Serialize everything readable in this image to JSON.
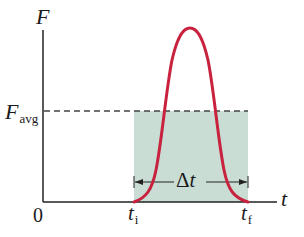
{
  "diagram": {
    "y_axis_label": "F",
    "x_axis_label": "t",
    "origin_label": "0",
    "favg_label": {
      "main": "F",
      "sub": "avg"
    },
    "ti_label": {
      "main": "t",
      "sub": "i"
    },
    "tf_label": {
      "main": "t",
      "sub": "f"
    },
    "delta_t_label": "Δt",
    "colors": {
      "axis": "#222222",
      "curve": "#c8223f",
      "shade": "#c9ddd4",
      "dashed": "#444444",
      "text": "#1a1a1a"
    }
  },
  "chart_data": {
    "type": "line",
    "title": "",
    "xlabel": "t",
    "ylabel": "F",
    "x_ticks": [
      "0",
      "t_i",
      "t_f"
    ],
    "y_ticks": [
      "F_avg"
    ],
    "series": [
      {
        "name": "F(t)",
        "description": "Force pulse: zero before t_i, rises to a single peak near the midpoint, returns to zero at t_f"
      }
    ],
    "annotations": [
      {
        "type": "hline",
        "label": "F_avg",
        "style": "dashed"
      },
      {
        "type": "rect",
        "label": "Area F_avg × Δt (equal to area under curve)",
        "x": [
          "t_i",
          "t_f"
        ],
        "y": [
          0,
          "F_avg"
        ]
      },
      {
        "type": "interval-arrow",
        "label": "Δt",
        "x": [
          "t_i",
          "t_f"
        ]
      }
    ],
    "grid": false
  }
}
